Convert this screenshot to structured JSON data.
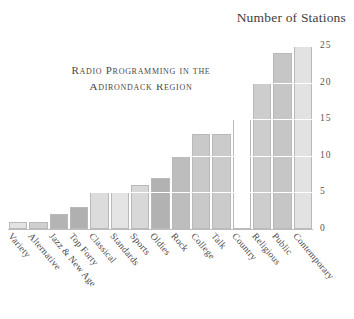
{
  "axis_heading": "Number of Stations",
  "title_lines": [
    "Radio Programming in the",
    "Adirondack Region"
  ],
  "chart_data": {
    "type": "bar",
    "title": "Radio Programming in the Adirondack Region",
    "subtitle": "",
    "xlabel": "",
    "ylabel": "Number of Stations",
    "ylim": [
      0,
      25
    ],
    "yticks": [
      0,
      5,
      10,
      15,
      20,
      25
    ],
    "ytick_labels": [
      "0",
      "5",
      "10",
      "15",
      "20",
      "25"
    ],
    "grid": true,
    "grid_color": "#ffffff",
    "legend": "none",
    "categories": [
      "Variety",
      "Alternative",
      "Jazz & New Age",
      "Top Forty",
      "Classical",
      "Standards",
      "Sports",
      "Oldies",
      "Rock",
      "College",
      "Talk",
      "Country",
      "Religious",
      "Public",
      "Contemporary"
    ],
    "values": [
      1,
      1,
      2,
      3,
      5,
      5,
      6,
      7,
      10,
      13,
      13,
      15,
      20,
      24,
      25
    ],
    "bar_colors": [
      "#e3e3e3",
      "#cfcfcf",
      "#b4b4b4",
      "#b0b0b0",
      "#dcdcdc",
      "#e4e4e4",
      "#d8d8d8",
      "#b2b2b2",
      "#bdbdbd",
      "#c9c9c9",
      "#cbcbcb",
      "#ffffff",
      "#cdcdcd",
      "#c6c6c6",
      "#e2e2e2"
    ],
    "bar_border_color": "#b9b9b9"
  }
}
